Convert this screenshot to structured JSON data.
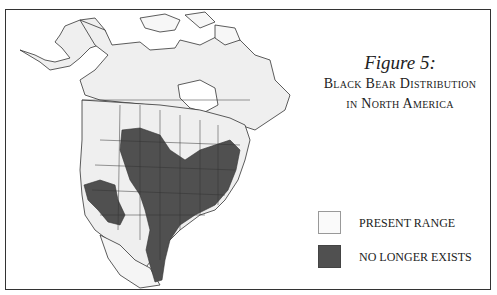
{
  "figure": {
    "label": "Figure 5:",
    "title_line1": "Black Bear Distribution",
    "title_line2": "in North America"
  },
  "legend": {
    "items": [
      {
        "label": "PRESENT RANGE",
        "color": "#fafafa"
      },
      {
        "label": "NO LONGER EXISTS",
        "color": "#505050"
      }
    ]
  },
  "colors": {
    "present_range": "#efefef",
    "no_longer_exists": "#505050",
    "outline": "#333333"
  }
}
